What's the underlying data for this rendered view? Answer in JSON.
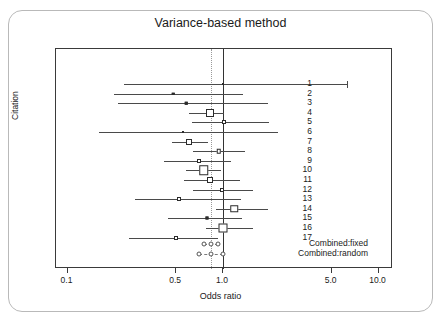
{
  "card": {
    "top_strip_fragments": [
      "",
      ""
    ]
  },
  "chart_data": {
    "type": "forest",
    "title": "Variance-based method",
    "xlabel": "Odds ratio",
    "ylabel": "Citation",
    "xscale": "log",
    "xlim": [
      0.1,
      12.0
    ],
    "xticks": [
      0.1,
      0.5,
      1.0,
      5.0,
      10.0
    ],
    "xtick_labels": [
      "0.1",
      "0.5",
      "1.0",
      "5.0",
      "10.0"
    ],
    "grid": false,
    "null_line": 1.0,
    "pooled_line": 0.84,
    "categories": [
      "1",
      "2",
      "3",
      "4",
      "5",
      "6",
      "7",
      "8",
      "9",
      "10",
      "11",
      "12",
      "13",
      "14",
      "15",
      "16",
      "17"
    ],
    "studies": [
      {
        "label": "1",
        "or": 1.0,
        "lo": 0.23,
        "hi": 6.3,
        "marker": 2.0,
        "filled": true,
        "cap_right": true
      },
      {
        "label": "2",
        "or": 0.48,
        "lo": 0.2,
        "hi": 1.35,
        "marker": 2.5,
        "filled": true,
        "cap_right": false
      },
      {
        "label": "3",
        "or": 0.58,
        "lo": 0.21,
        "hi": 1.95,
        "marker": 2.5,
        "filled": true,
        "cap_right": false
      },
      {
        "label": "4",
        "or": 0.82,
        "lo": 0.6,
        "hi": 1.02,
        "marker": 8.0,
        "filled": false,
        "cap_right": false
      },
      {
        "label": "5",
        "or": 1.02,
        "lo": 0.63,
        "hi": 1.98,
        "marker": 4.0,
        "filled": false,
        "cap_right": false
      },
      {
        "label": "6",
        "or": 0.55,
        "lo": 0.16,
        "hi": 2.25,
        "marker": 2.0,
        "filled": true,
        "cap_right": false
      },
      {
        "label": "7",
        "or": 0.6,
        "lo": 0.47,
        "hi": 0.8,
        "marker": 6.0,
        "filled": false,
        "cap_right": false
      },
      {
        "label": "8",
        "or": 0.94,
        "lo": 0.64,
        "hi": 1.38,
        "marker": 4.5,
        "filled": false,
        "cap_right": false
      },
      {
        "label": "9",
        "or": 0.7,
        "lo": 0.42,
        "hi": 1.13,
        "marker": 4.0,
        "filled": false,
        "cap_right": false
      },
      {
        "label": "10",
        "or": 0.75,
        "lo": 0.58,
        "hi": 0.97,
        "marker": 9.5,
        "filled": false,
        "cap_right": false
      },
      {
        "label": "11",
        "or": 0.82,
        "lo": 0.56,
        "hi": 1.28,
        "marker": 6.0,
        "filled": false,
        "cap_right": false
      },
      {
        "label": "12",
        "or": 0.98,
        "lo": 0.64,
        "hi": 1.55,
        "marker": 4.0,
        "filled": false,
        "cap_right": false
      },
      {
        "label": "13",
        "or": 0.52,
        "lo": 0.27,
        "hi": 1.3,
        "marker": 4.0,
        "filled": false,
        "cap_right": false
      },
      {
        "label": "14",
        "or": 1.18,
        "lo": 0.9,
        "hi": 1.95,
        "marker": 7.5,
        "filled": false,
        "cap_right": false
      },
      {
        "label": "15",
        "or": 0.79,
        "lo": 0.44,
        "hi": 1.32,
        "marker": 3.0,
        "filled": true,
        "cap_right": false
      },
      {
        "label": "16",
        "or": 1.0,
        "lo": 0.78,
        "hi": 1.55,
        "marker": 9.0,
        "filled": false,
        "cap_right": false
      },
      {
        "label": "17",
        "or": 0.5,
        "lo": 0.25,
        "hi": 0.93,
        "marker": 4.0,
        "filled": false,
        "cap_right": false
      }
    ],
    "combined": [
      {
        "label": "Combined:fixed",
        "or": 0.84,
        "lo": 0.76,
        "hi": 0.93
      },
      {
        "label": "Combined:random",
        "or": 0.84,
        "lo": 0.7,
        "hi": 1.0
      }
    ]
  }
}
